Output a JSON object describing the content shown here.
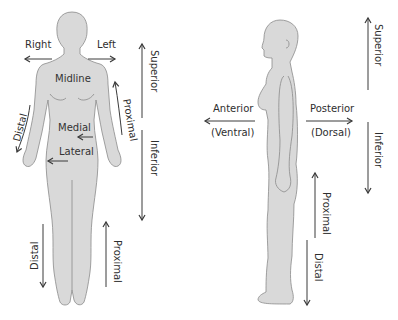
{
  "diagram": {
    "colors": {
      "body_fill": "#d9d9d9",
      "body_stroke": "#8a8a8a",
      "arrow": "#3a3a3a",
      "text": "#2e2e2e",
      "background": "#ffffff"
    },
    "front_view": {
      "labels": {
        "right": "Right",
        "left": "Left",
        "midline": "Midline",
        "medial": "Medial",
        "lateral": "Lateral",
        "superior": "Superior",
        "inferior": "Inferior",
        "proximal_arm": "Proximal",
        "distal_arm": "Distal",
        "proximal_leg": "Proximal",
        "distal_leg": "Distal"
      }
    },
    "side_view": {
      "labels": {
        "anterior": "Anterior",
        "ventral": "(Ventral)",
        "posterior": "Posterior",
        "dorsal": "(Dorsal)",
        "superior": "Superior",
        "inferior": "Inferior",
        "proximal_leg": "Proximal",
        "distal_leg": "Distal"
      }
    }
  }
}
